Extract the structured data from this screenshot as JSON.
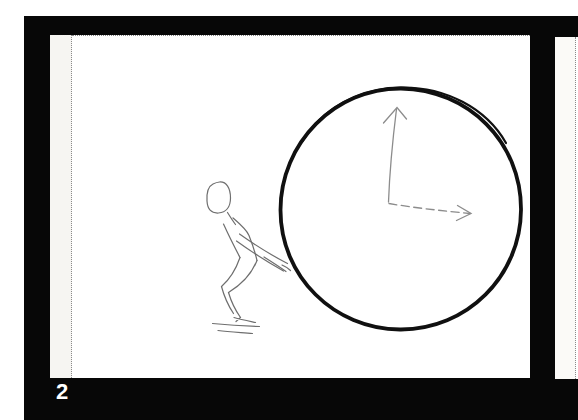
{
  "page": {
    "kind": "scanned storyboard filmstrip page",
    "margin_color": "#ffffff",
    "frame_background": "#070707"
  },
  "frame": {
    "number_label": "2",
    "number_color": "#ffffff"
  },
  "slide_current": {
    "background": "#ffffff",
    "strip_color": "#f6f5f2",
    "edge_dot_color": "#8a8a8a",
    "sketch": {
      "description": "Hand-drawn crouching figure pushing a large clock face from the left",
      "clock_stroke": "#101010",
      "hand_stroke": "#8c8c8c",
      "figure_stroke": "#6e6e6e",
      "minute_hand": "arrow pointing up to 12",
      "hour_hand": "dashed arrow pointing right to 3",
      "time_shown": "3:00"
    }
  },
  "slide_next": {
    "background": "#ffffff",
    "description": "partially visible next frame at right edge"
  }
}
